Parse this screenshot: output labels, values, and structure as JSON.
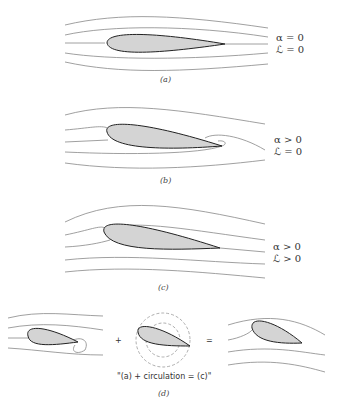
{
  "panels": [
    {
      "id": "a",
      "caption": "(a)",
      "line1": "α = 0",
      "line2": "ℒ = 0"
    },
    {
      "id": "b",
      "caption": "(b)",
      "line1": "α > 0",
      "line2": "ℒ = 0"
    },
    {
      "id": "c",
      "caption": "(c)",
      "line1": "α > 0",
      "line2": "ℒ > 0"
    },
    {
      "id": "d",
      "caption": "(d)",
      "equation": "\"(a) + circulation = (c)\"",
      "plus": "+",
      "equals": "="
    }
  ],
  "colors": {
    "stream": "#777777",
    "airfoil_fill": "#d4d4d4",
    "airfoil_stroke": "#222222",
    "circulation": "#888888"
  }
}
